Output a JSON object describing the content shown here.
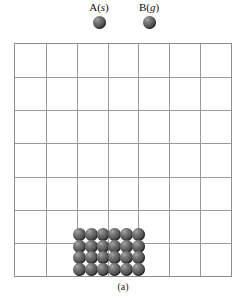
{
  "figure": {
    "caption": "(a)",
    "legend": {
      "items": [
        {
          "name": "A",
          "label_prefix": "A",
          "state": "s",
          "label_full": "A(s)",
          "sphere_color": "#555555"
        },
        {
          "name": "B",
          "label_prefix": "B",
          "state": "g",
          "label_full": "B(g)",
          "sphere_color": "#555555"
        }
      ]
    },
    "container": {
      "name": "reaction-vessel-grid",
      "columns": 7,
      "rows": 7,
      "line_color": "#9a9a9a",
      "border_color": "#8e8e8e",
      "background": "#ffffff"
    },
    "solid_block": {
      "name": "solid-A-lattice",
      "substance": "A",
      "state": "s",
      "columns": 6,
      "rows": 4,
      "particle_count": 24,
      "particle_color": "#555555",
      "position": "bottom-center-left"
    },
    "gas_particles": {
      "name": "gas-B-particles",
      "substance": "B",
      "state": "g",
      "count": 0
    }
  }
}
